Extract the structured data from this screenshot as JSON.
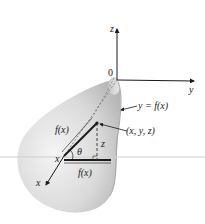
{
  "figure": {
    "type": "solid-of-revolution",
    "axes": {
      "z_label": "z",
      "y_label": "y",
      "x_label": "x",
      "origin_label": "0"
    },
    "labels": {
      "curve": "y = f(x)",
      "point": "(x, y, z)",
      "radius_slant": "f(x)",
      "radius_horizontal": "f(x)",
      "height": "z",
      "angle": "θ",
      "x_on_axis": "x"
    },
    "colors": {
      "surface_light": "#f2f2f2",
      "surface_mid": "#cfcfcf",
      "surface_dark": "#a9a9a9",
      "ink": "#1a1a1a",
      "dash": "#555555"
    }
  }
}
